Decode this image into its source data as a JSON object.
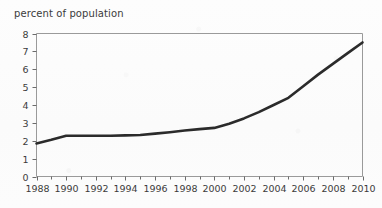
{
  "chart_data": {
    "type": "line",
    "title": "percent of population",
    "xlabel": "",
    "ylabel": "percent of population",
    "grid": false,
    "legend": "none",
    "xlim": [
      1988,
      2010
    ],
    "ylim": [
      0,
      8
    ],
    "x_tick_labels": [
      "1988",
      "1990",
      "1992",
      "1994",
      "1996",
      "1998",
      "2000",
      "2002",
      "2004",
      "2006",
      "2008",
      "2010"
    ],
    "x_tick_label_values": [
      1988,
      1990,
      1992,
      1994,
      1996,
      1998,
      2000,
      2002,
      2004,
      2006,
      2008,
      2010
    ],
    "x_minor_ticks": [
      1989,
      1991,
      1993,
      1995,
      1997,
      1999,
      2001,
      2003,
      2005,
      2007,
      2009
    ],
    "y_tick_labels": [
      "0",
      "1",
      "2",
      "3",
      "4",
      "5",
      "6",
      "7",
      "8"
    ],
    "y_tick_values": [
      0,
      1,
      2,
      3,
      4,
      5,
      6,
      7,
      8
    ],
    "series": [
      {
        "name": "percent of population",
        "color": "#2b2b2b",
        "x": [
          1988,
          1989,
          1990,
          1991,
          1992,
          1993,
          1994,
          1995,
          1996,
          1997,
          1998,
          1999,
          2000,
          2001,
          2002,
          2003,
          2004,
          2005,
          2006,
          2007,
          2008,
          2009,
          2010
        ],
        "values": [
          1.85,
          2.05,
          2.28,
          2.28,
          2.28,
          2.28,
          2.3,
          2.32,
          2.4,
          2.48,
          2.57,
          2.65,
          2.72,
          2.95,
          3.25,
          3.6,
          4.0,
          4.4,
          5.05,
          5.7,
          6.3,
          6.9,
          7.5
        ]
      }
    ]
  },
  "axes": {
    "title_text": "percent of population",
    "frame_color": "#9a9a9a",
    "tick_color": "#6b6b6b",
    "text_color": "#3b3b3b"
  }
}
